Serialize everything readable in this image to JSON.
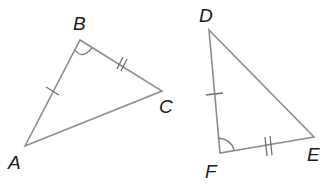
{
  "diagram": {
    "type": "congruent-triangles",
    "colors": {
      "stroke": "#8c8c8c",
      "label": "#1a1a1a",
      "background": "#ffffff"
    },
    "triangles": [
      {
        "name": "ABC",
        "vertices": [
          {
            "label": "A",
            "x": 25,
            "y": 146
          },
          {
            "label": "B",
            "x": 80,
            "y": 40
          },
          {
            "label": "C",
            "x": 162,
            "y": 91
          }
        ],
        "marks": [
          {
            "side": "AB",
            "ticks": 1
          },
          {
            "side": "BC",
            "ticks": 2
          },
          {
            "angle": "B",
            "arcs": 1
          }
        ]
      },
      {
        "name": "DEF",
        "vertices": [
          {
            "label": "D",
            "x": 209,
            "y": 30
          },
          {
            "label": "E",
            "x": 314,
            "y": 137
          },
          {
            "label": "F",
            "x": 220,
            "y": 153
          }
        ],
        "marks": [
          {
            "side": "DF",
            "ticks": 1
          },
          {
            "side": "FE",
            "ticks": 2
          },
          {
            "angle": "F",
            "arcs": 1
          }
        ]
      }
    ],
    "labels": {
      "A": "A",
      "B": "B",
      "C": "C",
      "D": "D",
      "E": "E",
      "F": "F"
    }
  }
}
